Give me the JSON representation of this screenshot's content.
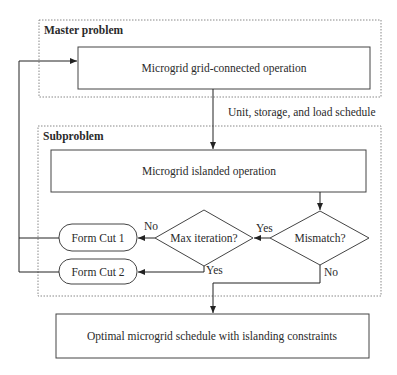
{
  "groups": {
    "master": {
      "title": "Master problem"
    },
    "subproblem": {
      "title": "Subproblem"
    }
  },
  "nodes": {
    "grid_connected": "Microgrid grid-connected operation",
    "islanded": "Microgrid islanded operation",
    "mismatch": "Mismatch?",
    "max_iteration": "Max iteration?",
    "form_cut_1": "Form Cut 1",
    "form_cut_2": "Form Cut 2",
    "optimal": "Optimal microgrid schedule with islanding constraints"
  },
  "edges": {
    "schedule_label": "Unit, storage, and load schedule",
    "mismatch_yes": "Yes",
    "mismatch_no": "No",
    "maxiter_no": "No",
    "maxiter_yes": "Yes"
  },
  "colors": {
    "line": "#333333",
    "dashed": "#888888",
    "background": "#ffffff"
  }
}
